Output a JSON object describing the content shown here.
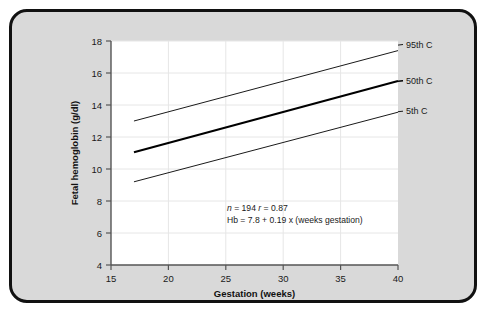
{
  "figure": {
    "background_color": "#d9d9d9",
    "border_color": "#111111",
    "plot_background_color": "#ffffff",
    "gridline_color": "#e6e6e6",
    "axis_color": "#555555"
  },
  "chart_data": {
    "type": "line",
    "title": "",
    "xlabel": "Gestation (weeks)",
    "ylabel": "Fetal hemoglobin (g/dl)",
    "xlim": [
      15,
      40
    ],
    "ylim": [
      4,
      18
    ],
    "xticks": [
      15,
      20,
      25,
      30,
      35,
      40
    ],
    "yticks": [
      4,
      6,
      8,
      10,
      12,
      14,
      16,
      18
    ],
    "xtick_labels": [
      "15",
      "20",
      "25",
      "30",
      "35",
      "40"
    ],
    "ytick_labels": [
      "4",
      "6",
      "8",
      "10",
      "12",
      "14",
      "16",
      "18"
    ],
    "grid": true,
    "legend_position": "right-inline",
    "x": [
      17,
      40
    ],
    "series": [
      {
        "name": "95th C",
        "label": "95th C",
        "values": [
          13.0,
          17.4
        ],
        "color": "#1a1a1a",
        "width": 1.0
      },
      {
        "name": "50th C",
        "label": "50th C",
        "values": [
          11.05,
          15.5
        ],
        "color": "#000000",
        "width": 2.1
      },
      {
        "name": "5th C",
        "label": "5th C",
        "values": [
          9.2,
          13.55
        ],
        "color": "#1a1a1a",
        "width": 1.0
      }
    ],
    "annotations": [
      {
        "id": "stats-line",
        "text": "n = 194   r = 0.87",
        "parts": [
          {
            "text": "n",
            "italic": true
          },
          {
            "text": " = 194  ",
            "italic": false
          },
          {
            "text": "r",
            "italic": true
          },
          {
            "text": " = 0.87",
            "italic": false
          }
        ],
        "x": 25.1,
        "y": 8.6
      },
      {
        "id": "regression-line",
        "text": "Hb = 7.8 + 0.19 x (weeks gestation)",
        "x": 25.1,
        "y": 8.0
      }
    ]
  }
}
